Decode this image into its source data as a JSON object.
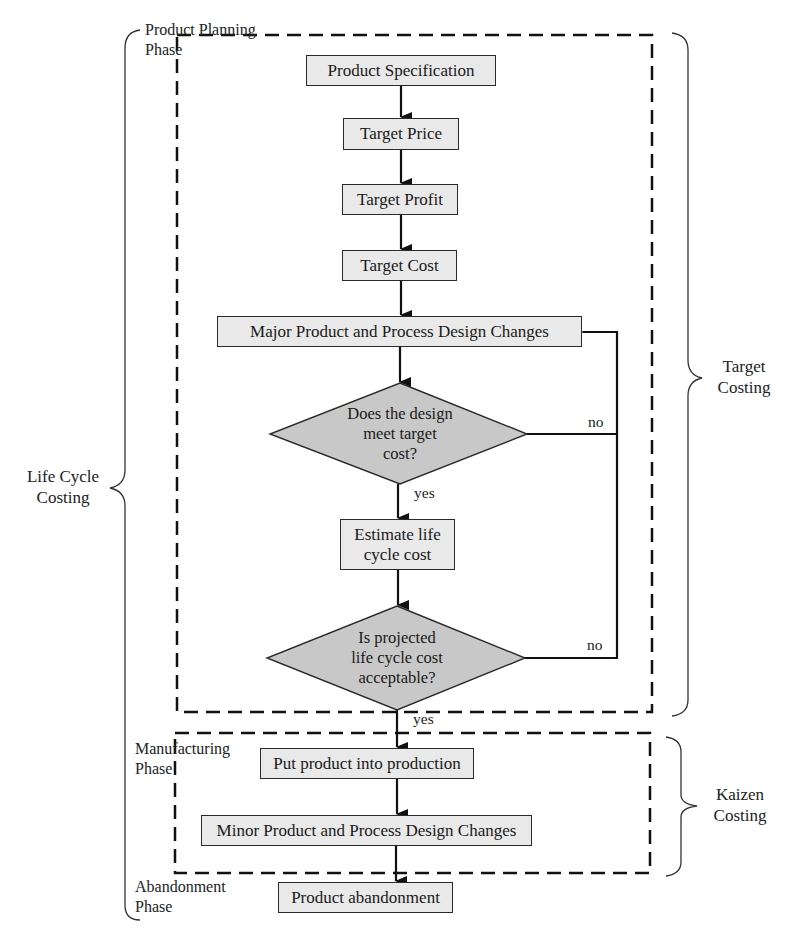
{
  "diagram": {
    "phases": {
      "planning": "Product Planning Phase",
      "planning_line1": "Product Planning",
      "planning_line2": "Phase",
      "manufacturing_line1": "Manufacturing",
      "manufacturing_line2": "Phase",
      "abandonment_line1": "Abandonment",
      "abandonment_line2": "Phase"
    },
    "brackets": {
      "life_cycle_line1": "Life Cycle",
      "life_cycle_line2": "Costing",
      "target_line1": "Target",
      "target_line2": "Costing",
      "kaizen_line1": "Kaizen",
      "kaizen_line2": "Costing"
    },
    "nodes": {
      "product_spec": "Product Specification",
      "target_price": "Target Price",
      "target_profit": "Target Profit",
      "target_cost": "Target Cost",
      "major_changes": "Major Product and Process Design Changes",
      "decision1_line1": "Does the design",
      "decision1_line2": "meet target",
      "decision1_line3": "cost?",
      "estimate_line1": "Estimate life",
      "estimate_line2": "cycle cost",
      "decision2_line1": "Is projected",
      "decision2_line2": "life cycle cost",
      "decision2_line3": "acceptable?",
      "production": "Put product into production",
      "minor_changes": "Minor Product and Process Design Changes",
      "abandonment": "Product abandonment"
    },
    "edges": {
      "d1_yes": "yes",
      "d1_no": "no",
      "d2_yes": "yes",
      "d2_no": "no"
    },
    "colors": {
      "box_fill": "#e9e9e9",
      "diamond_fill": "#c8c8c8",
      "line": "#111111"
    }
  }
}
